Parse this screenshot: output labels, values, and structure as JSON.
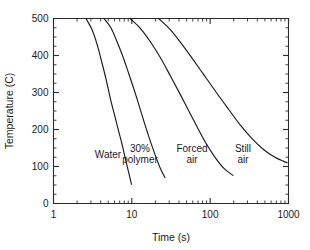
{
  "chart_data": {
    "type": "line",
    "title": "",
    "xlabel": "Time (s)",
    "ylabel": "Temperature (C)",
    "xscale": "log",
    "yscale": "linear",
    "xlim": [
      1,
      1000
    ],
    "ylim": [
      0,
      500
    ],
    "xticks": [
      1,
      10,
      100,
      1000
    ],
    "xticklabels": [
      "1",
      "10",
      "100",
      "1000"
    ],
    "yticks": [
      0,
      100,
      200,
      300,
      400,
      500
    ],
    "yticklabels": [
      "0",
      "100",
      "200",
      "300",
      "400",
      "500"
    ],
    "grid": false,
    "legend": "inline-annotations",
    "minor_ticks": true,
    "series": [
      {
        "name": "Water",
        "label": "Water",
        "points": [
          [
            2.6,
            500
          ],
          [
            3.1,
            470
          ],
          [
            3.6,
            430
          ],
          [
            4.1,
            385
          ],
          [
            4.7,
            335
          ],
          [
            5.3,
            285
          ],
          [
            6.0,
            240
          ],
          [
            6.8,
            195
          ],
          [
            7.6,
            155
          ],
          [
            8.4,
            115
          ],
          [
            9.2,
            80
          ],
          [
            9.9,
            52
          ]
        ]
      },
      {
        "name": "30% polymer",
        "label": "30%\npolymer",
        "label_line1": "30%",
        "label_line2": "polymer",
        "points": [
          [
            4.4,
            500
          ],
          [
            5.4,
            475
          ],
          [
            6.4,
            440
          ],
          [
            7.6,
            400
          ],
          [
            9.0,
            355
          ],
          [
            10.6,
            310
          ],
          [
            12.5,
            262
          ],
          [
            14.6,
            215
          ],
          [
            17.0,
            172
          ],
          [
            19.8,
            132
          ],
          [
            23.0,
            96
          ],
          [
            26.5,
            70
          ]
        ]
      },
      {
        "name": "Forced air",
        "label": "Forced\nair",
        "label_line1": "Forced",
        "label_line2": "air",
        "points": [
          [
            9.5,
            500
          ],
          [
            13.0,
            472
          ],
          [
            17.5,
            435
          ],
          [
            23.5,
            392
          ],
          [
            31.0,
            345
          ],
          [
            41.0,
            297
          ],
          [
            54.0,
            248
          ],
          [
            70.0,
            202
          ],
          [
            90.0,
            160
          ],
          [
            116.0,
            124
          ],
          [
            150.0,
            95
          ],
          [
            195.0,
            76
          ]
        ]
      },
      {
        "name": "Still air",
        "label": "Still\nair",
        "label_line1": "Still",
        "label_line2": "air",
        "points": [
          [
            22.0,
            500
          ],
          [
            31.0,
            470
          ],
          [
            43.0,
            432
          ],
          [
            60.0,
            390
          ],
          [
            85.0,
            345
          ],
          [
            120.0,
            300
          ],
          [
            170.0,
            256
          ],
          [
            240.0,
            213
          ],
          [
            340.0,
            176
          ],
          [
            480.0,
            146
          ],
          [
            680.0,
            124
          ],
          [
            960.0,
            110
          ]
        ]
      }
    ],
    "annotations": [
      {
        "text": "Water",
        "x_px": 108,
        "y_px": 158
      },
      {
        "text": "30%",
        "x_px": 140,
        "y_px": 152
      },
      {
        "text": "polymer",
        "x_px": 140,
        "y_px": 163
      },
      {
        "text": "Forced",
        "x_px": 192,
        "y_px": 152
      },
      {
        "text": "air",
        "x_px": 192,
        "y_px": 163
      },
      {
        "text": "Still",
        "x_px": 243,
        "y_px": 152
      },
      {
        "text": "air",
        "x_px": 243,
        "y_px": 163
      }
    ]
  },
  "colors": {
    "background": "#ffffff",
    "axis": "#2b2b2b",
    "curve": "#1a1a1a",
    "text": "#1a1a1a"
  }
}
